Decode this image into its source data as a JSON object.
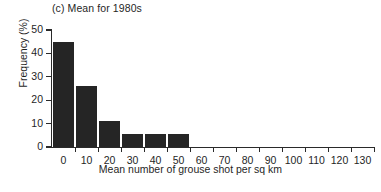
{
  "chart_data": {
    "type": "bar",
    "title": "(c) Mean for 1980s",
    "xlabel": "Mean number of grouse shot per sq km",
    "ylabel": "Frequency (%)",
    "categories": [
      "0",
      "10",
      "20",
      "30",
      "40",
      "50",
      "60",
      "70",
      "80",
      "90",
      "100",
      "110",
      "120",
      "130"
    ],
    "values": [
      45,
      26,
      11,
      5.5,
      5.5,
      5.5,
      0,
      0,
      0,
      0,
      0,
      0,
      0,
      0
    ],
    "bin_width": 10,
    "xlim": [
      0,
      140
    ],
    "ylim": [
      0,
      50
    ],
    "xticks": [
      0,
      10,
      20,
      30,
      40,
      50,
      60,
      70,
      80,
      90,
      100,
      110,
      120,
      130
    ],
    "yticks": [
      0,
      10,
      20,
      30,
      40,
      50
    ],
    "grid": false,
    "legend": false,
    "bar_color": "#252525",
    "axis_color": "#2a2a2a",
    "background": "#ffffff"
  }
}
